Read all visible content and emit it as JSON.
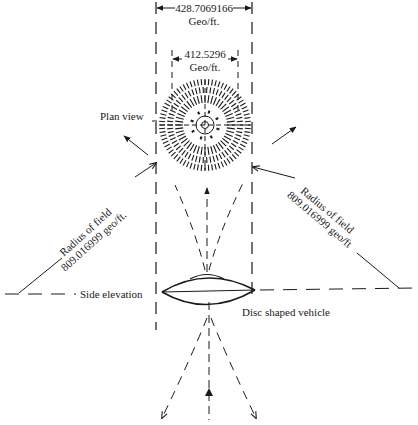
{
  "diagram": {
    "outer_dimension": {
      "value": "428.7069166",
      "unit": "Geo/ft."
    },
    "inner_dimension": {
      "value": "412.5296",
      "unit": "Geo/ft."
    },
    "plan_view_label": "Plan view",
    "side_elevation_label": "Side elevation",
    "vehicle_label": "Disc shaped vehicle",
    "left_radius": {
      "line1": "Radius of field",
      "line2": "809.016999 geo/ft."
    },
    "right_radius": {
      "line1": "Radius of field",
      "line2": "809.016999 geo/ft"
    }
  }
}
